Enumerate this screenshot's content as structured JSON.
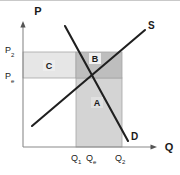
{
  "figure": {
    "kind": "supply-demand-diagram",
    "background_color": "#ffffff",
    "border_color": "#c9c9c9"
  },
  "axes": {
    "vertical": {
      "title": "P",
      "name": "price-axis",
      "color": "#8a8a8a",
      "x": 23,
      "top": 24,
      "bottom": 147
    },
    "horizontal": {
      "title": "Q",
      "name": "quantity-axis",
      "color": "#8a8a8a",
      "y": 147,
      "left": 23,
      "right": 155
    }
  },
  "price_ticks": [
    {
      "label": "P",
      "subscript": "2",
      "value_y": 52
    },
    {
      "label": "P",
      "subscript": "e",
      "value_y": 78
    }
  ],
  "quantity_ticks": [
    {
      "label": "Q",
      "subscript": "1",
      "value_x": 76
    },
    {
      "label": "Q",
      "subscript": "e",
      "value_x": 90
    },
    {
      "label": "Q",
      "subscript": "2",
      "value_x": 122
    }
  ],
  "curves": [
    {
      "name": "supply-curve",
      "label": "S",
      "color": "#1a1a1a",
      "x1": 32,
      "y1": 126,
      "x2": 145,
      "y2": 30,
      "label_x": 148,
      "label_y": 26
    },
    {
      "name": "demand-curve",
      "label": "D",
      "color": "#1a1a1a",
      "x1": 65,
      "y1": 26,
      "x2": 128,
      "y2": 141,
      "label_x": 131,
      "label_y": 138
    }
  ],
  "regions": [
    {
      "name": "region-c",
      "label": "C",
      "fill": "#e3e3e3",
      "stroke": "#9a9a9a",
      "x": 23,
      "y": 52,
      "width": 53,
      "height": 26,
      "label_x": 49,
      "label_y": 68
    },
    {
      "name": "region-b",
      "label": "B",
      "fill": "#bfbfbf",
      "stroke": "#9a9a9a",
      "x": 76,
      "y": 52,
      "width": 46,
      "height": 26,
      "label_x": 95,
      "label_y": 62
    },
    {
      "name": "region-a",
      "label": "A",
      "fill": "#d2d2d2",
      "stroke": "#9a9a9a",
      "x": 76,
      "y": 78,
      "width": 46,
      "height": 69,
      "label_x": 97,
      "label_y": 105
    }
  ],
  "equilibrium": {
    "name": "equilibrium-point",
    "x": 84,
    "y": 78
  }
}
